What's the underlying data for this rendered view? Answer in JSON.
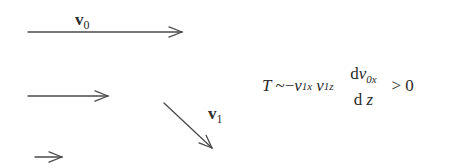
{
  "diagram": {
    "arrows": [
      {
        "id": "v0-long",
        "x1": 28,
        "y1": 32,
        "x2": 182,
        "y2": 32
      },
      {
        "id": "v0-medium",
        "x1": 28,
        "y1": 96,
        "x2": 108,
        "y2": 96
      },
      {
        "id": "v0-short",
        "x1": 35,
        "y1": 157,
        "x2": 62,
        "y2": 157
      },
      {
        "id": "v1",
        "x1": 164,
        "y1": 103,
        "x2": 212,
        "y2": 148
      }
    ],
    "stroke_color": "#4a4a4a",
    "labels": {
      "v0": {
        "base": "v",
        "sub": "0"
      },
      "v1": {
        "base": "v",
        "sub": "1"
      }
    }
  },
  "formula": {
    "lhs": "T",
    "relation": "~",
    "minus": "−",
    "v1x_base": "v",
    "v1x_sub": "1x",
    "v1z_base": "v",
    "v1z_sub": "1z",
    "numerator_d": "d",
    "numerator_v": "v",
    "numerator_sub": "0x",
    "denominator_d": "d",
    "denominator_z": "z",
    "comparison": ">",
    "rhs": "0"
  }
}
